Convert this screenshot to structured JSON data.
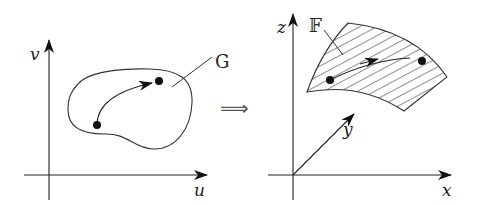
{
  "diagram": {
    "left_panel": {
      "axes": {
        "horizontal_label": "u",
        "vertical_label": "v"
      },
      "region_label": "G",
      "region_style": "outlined blob (unfilled)",
      "path": {
        "start_point": "dot",
        "end_point": "dot",
        "arrow_direction": "toward upper-right dot"
      }
    },
    "transition_symbol": "⟹",
    "right_panel": {
      "axes": {
        "x_label": "x",
        "y_label": "y",
        "z_label": "z"
      },
      "surface_label": "𝔽",
      "surface_style": "hatched curved surface patch",
      "path": {
        "start_point": "dot",
        "end_point": "dot",
        "arrow_direction": "toward right dot"
      }
    },
    "colors": {
      "stroke": "#222222",
      "background": "#ffffff",
      "implies_symbol": "#555555"
    }
  }
}
